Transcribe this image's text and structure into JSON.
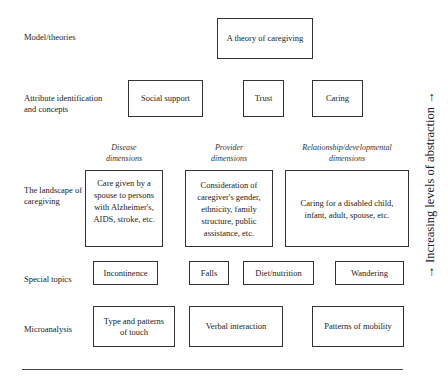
{
  "diagram": {
    "rows": [
      {
        "label": "Model/theories"
      },
      {
        "label": "Attribute identification and concepts",
        "line1": "Attribute identification",
        "line2": "and concepts"
      },
      {
        "label": "The landscape of caregiving",
        "line1": "The landscape of",
        "line2": "caregiving"
      },
      {
        "label": "Special topics"
      },
      {
        "label": "Microanalysis"
      }
    ],
    "model": {
      "boxes": [
        "A theory of caregiving"
      ]
    },
    "attributes": {
      "boxes": [
        "Social support",
        "Trust",
        "Caring"
      ]
    },
    "landscape": {
      "columns": [
        {
          "header1": "Disease",
          "header2": "dimensions",
          "lines": [
            "Care given by a",
            "spouse to persons",
            "with Alzheimer's,",
            "AIDS, stroke, etc."
          ]
        },
        {
          "header1": "Provider",
          "header2": "dimensions",
          "lines": [
            "Consideration of",
            "caregiver's gender,",
            "ethnicity, family",
            "structure, public",
            "assistance, etc."
          ]
        },
        {
          "header1": "Relationship/developmental",
          "header2": "dimensions",
          "lines": [
            "Caring for a disabled child,",
            "infant, adult, spouse, etc."
          ]
        }
      ]
    },
    "special_topics": {
      "boxes": [
        "Incontinence",
        "Falls",
        "Diet/nutrition",
        "Wandering"
      ]
    },
    "microanalysis": {
      "boxes": [
        {
          "lines": [
            "Type and patterns",
            "of touch"
          ]
        },
        {
          "lines": [
            "Verbal interaction"
          ]
        },
        {
          "lines": [
            "Patterns of mobility"
          ]
        }
      ]
    },
    "axis_label": "→ Increasing levels of abstraction →"
  }
}
